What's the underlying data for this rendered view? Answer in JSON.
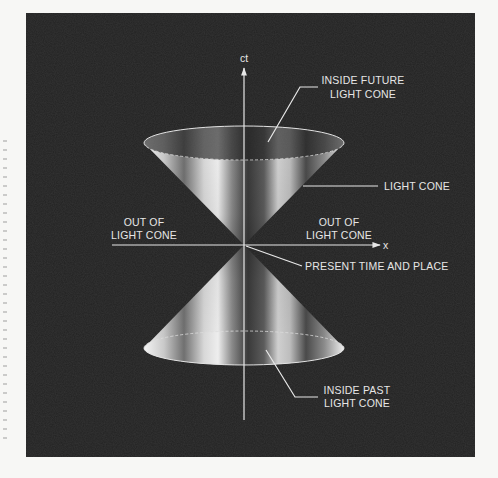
{
  "diagram": {
    "background_color": "#222222",
    "page_color": "#f7f7f5",
    "line_color": "#e8e8e8",
    "axes": {
      "vertical_label": "ct",
      "horizontal_label": "x"
    },
    "labels": {
      "future_line1": "INSIDE FUTURE",
      "future_line2": "LIGHT CONE",
      "light_cone": "LIGHT CONE",
      "out_left_line1": "OUT OF",
      "out_left_line2": "LIGHT CONE",
      "out_right_line1": "OUT OF",
      "out_right_line2": "LIGHT CONE",
      "present": "PRESENT TIME AND PLACE",
      "past_line1": "INSIDE PAST",
      "past_line2": "LIGHT CONE"
    }
  }
}
